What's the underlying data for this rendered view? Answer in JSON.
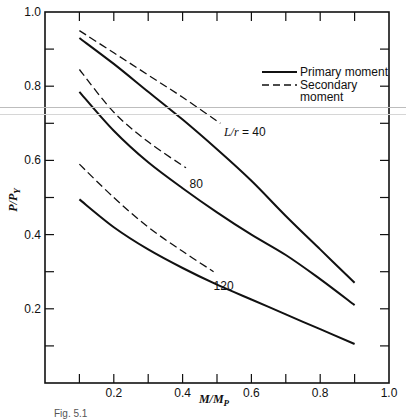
{
  "chart_data": {
    "type": "line",
    "title": "",
    "xlabel": "M/M_P",
    "ylabel": "P/P_Y",
    "xlim": [
      0,
      1.0
    ],
    "ylim": [
      0,
      1.0
    ],
    "x_ticks": [
      0.1,
      0.2,
      0.3,
      0.4,
      0.5,
      0.6,
      0.7,
      0.8,
      0.9,
      1.0
    ],
    "x_tick_labels": [
      "0.2",
      "0.4",
      "0.6",
      "0.8",
      "1.0"
    ],
    "x_tick_label_values": [
      0.2,
      0.4,
      0.6,
      0.8,
      1.0
    ],
    "y_ticks": [
      0.1,
      0.2,
      0.3,
      0.4,
      0.5,
      0.6,
      0.7,
      0.8,
      0.9,
      1.0
    ],
    "y_tick_labels": [
      "0.2",
      "0.4",
      "0.6",
      "0.8",
      "1.0"
    ],
    "y_tick_label_values": [
      0.2,
      0.4,
      0.6,
      0.8,
      1.0
    ],
    "grid": false,
    "legend": {
      "position": "upper right",
      "entries": [
        {
          "label": "Primary moment",
          "style": "solid"
        },
        {
          "label_lines": [
            "Secondary",
            "moment"
          ],
          "label": "Secondary moment",
          "style": "dashed"
        }
      ]
    },
    "series": [
      {
        "name": "L/r = 40, primary moment",
        "style": "solid",
        "x": [
          0.1,
          0.2,
          0.3,
          0.4,
          0.5,
          0.6,
          0.7,
          0.8,
          0.9
        ],
        "y": [
          0.93,
          0.86,
          0.785,
          0.71,
          0.63,
          0.545,
          0.45,
          0.36,
          0.27
        ]
      },
      {
        "name": "L/r = 40, secondary moment",
        "style": "dashed",
        "x": [
          0.1,
          0.2,
          0.3,
          0.4,
          0.51
        ],
        "y": [
          0.95,
          0.89,
          0.83,
          0.77,
          0.7
        ]
      },
      {
        "name": "L/r = 80, primary moment",
        "style": "solid",
        "x": [
          0.1,
          0.2,
          0.3,
          0.4,
          0.5,
          0.6,
          0.7,
          0.8,
          0.9
        ],
        "y": [
          0.785,
          0.68,
          0.595,
          0.525,
          0.46,
          0.4,
          0.345,
          0.28,
          0.21
        ]
      },
      {
        "name": "L/r = 80, secondary moment",
        "style": "dashed",
        "x": [
          0.1,
          0.2,
          0.3,
          0.41
        ],
        "y": [
          0.845,
          0.73,
          0.65,
          0.58
        ]
      },
      {
        "name": "L/r = 120, primary moment",
        "style": "solid",
        "x": [
          0.1,
          0.2,
          0.3,
          0.4,
          0.5,
          0.6,
          0.7,
          0.8,
          0.9
        ],
        "y": [
          0.495,
          0.42,
          0.36,
          0.31,
          0.265,
          0.225,
          0.185,
          0.145,
          0.105
        ]
      },
      {
        "name": "L/r = 120, secondary moment",
        "style": "dashed",
        "x": [
          0.1,
          0.2,
          0.3,
          0.4,
          0.49
        ],
        "y": [
          0.59,
          0.5,
          0.42,
          0.355,
          0.3
        ]
      }
    ],
    "annotations": [
      {
        "text_prefix": "L/r",
        "text": " = 40",
        "x": 0.52,
        "y": 0.665
      },
      {
        "text": "80",
        "x": 0.42,
        "y": 0.525
      },
      {
        "text": "120",
        "x": 0.49,
        "y": 0.25
      }
    ]
  },
  "caption": "Fig. 5.1"
}
